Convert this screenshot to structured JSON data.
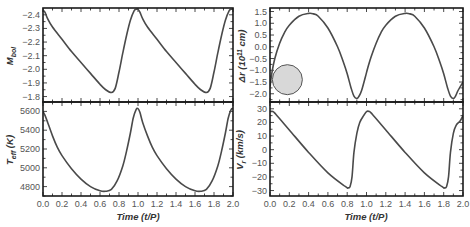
{
  "chart_data": [
    {
      "type": "line",
      "panel": "top-left",
      "title": "",
      "xlabel": "",
      "ylabel": "M_bol",
      "ylim": [
        -1.76,
        -2.45
      ],
      "y_inverted": true,
      "yticks": [
        -2.4,
        -2.3,
        -2.2,
        -2.1,
        -2.0,
        -1.9,
        -1.8
      ],
      "ytick_labels": [
        "-2.4",
        "-2.3",
        "-2.2",
        "-2.1",
        "-2.0",
        "-1.9",
        "-1.8"
      ],
      "xlim": [
        0.0,
        2.0
      ],
      "grid": false,
      "x": [
        0.0,
        0.02,
        0.05,
        0.1,
        0.2,
        0.3,
        0.4,
        0.5,
        0.6,
        0.66,
        0.72,
        0.76,
        0.8,
        0.84,
        0.88,
        0.92,
        0.96,
        0.98,
        1.0,
        1.02,
        1.05,
        1.1,
        1.2,
        1.3,
        1.4,
        1.5,
        1.6,
        1.66,
        1.72,
        1.76,
        1.8,
        1.84,
        1.88,
        1.92,
        1.96,
        1.98,
        2.0
      ],
      "values": [
        -2.43,
        -2.42,
        -2.37,
        -2.31,
        -2.22,
        -2.13,
        -2.05,
        -1.97,
        -1.89,
        -1.85,
        -1.83,
        -1.86,
        -1.98,
        -2.12,
        -2.25,
        -2.36,
        -2.43,
        -2.44,
        -2.44,
        -2.42,
        -2.37,
        -2.31,
        -2.22,
        -2.13,
        -2.05,
        -1.97,
        -1.89,
        -1.85,
        -1.83,
        -1.86,
        -1.98,
        -2.12,
        -2.25,
        -2.36,
        -2.43,
        -2.44,
        -2.44
      ]
    },
    {
      "type": "line",
      "panel": "bottom-left",
      "xlabel": "Time (t/P)",
      "ylabel": "T_eff (K)",
      "ylim": [
        4700,
        5700
      ],
      "yticks": [
        4800,
        5000,
        5200,
        5400,
        5600
      ],
      "ytick_labels": [
        "4800",
        "5000",
        "5200",
        "5400",
        "5600"
      ],
      "xlim": [
        0.0,
        2.0
      ],
      "xticks": [
        0.0,
        0.2,
        0.4,
        0.6,
        0.8,
        1.0,
        1.2,
        1.4,
        1.6,
        1.8,
        2.0
      ],
      "xtick_labels": [
        "0.0",
        "0.2",
        "0.4",
        "0.6",
        "0.8",
        "1.0",
        "1.2",
        "1.4",
        "1.6",
        "1.8",
        "2.0"
      ],
      "grid": false,
      "x": [
        0.0,
        0.02,
        0.05,
        0.1,
        0.15,
        0.2,
        0.3,
        0.4,
        0.5,
        0.6,
        0.66,
        0.72,
        0.78,
        0.84,
        0.88,
        0.92,
        0.95,
        0.98,
        1.0,
        1.02,
        1.05,
        1.1,
        1.15,
        1.2,
        1.3,
        1.4,
        1.5,
        1.6,
        1.66,
        1.72,
        1.78,
        1.84,
        1.88,
        1.92,
        1.95,
        1.98,
        2.0
      ],
      "values": [
        5600,
        5560,
        5480,
        5340,
        5220,
        5130,
        4990,
        4880,
        4800,
        4755,
        4750,
        4770,
        4860,
        5020,
        5180,
        5370,
        5530,
        5620,
        5630,
        5590,
        5480,
        5340,
        5220,
        5130,
        4990,
        4880,
        4800,
        4755,
        4750,
        4770,
        4860,
        5020,
        5180,
        5370,
        5530,
        5620,
        5630
      ]
    },
    {
      "type": "line",
      "panel": "top-right",
      "xlabel": "",
      "ylabel": "Δr (10^11 cm)",
      "ylim": [
        -2.35,
        1.65
      ],
      "yticks": [
        1.5,
        1.0,
        0.5,
        0.0,
        -0.5,
        -1.0,
        -1.5,
        -2.0
      ],
      "ytick_labels": [
        "1.5",
        "1.0",
        "0.5",
        "0.0",
        "-0.5",
        "-1.0",
        "-1.5",
        "-2.0"
      ],
      "xlim": [
        0.0,
        2.0
      ],
      "grid": false,
      "annotation": {
        "shape": "circle",
        "fill": "#d8d8d8",
        "stroke": "#555555",
        "cx_t": 0.18,
        "cy_val": -1.4,
        "radius_px": 15
      },
      "x": [
        0.0,
        0.02,
        0.05,
        0.1,
        0.15,
        0.2,
        0.3,
        0.4,
        0.45,
        0.5,
        0.6,
        0.7,
        0.76,
        0.8,
        0.84,
        0.87,
        0.9,
        0.92,
        0.95,
        1.0,
        1.02,
        1.05,
        1.1,
        1.15,
        1.2,
        1.3,
        1.4,
        1.45,
        1.5,
        1.6,
        1.7,
        1.76,
        1.8,
        1.84,
        1.87,
        1.9,
        1.92,
        1.95,
        2.0
      ],
      "values": [
        -1.7,
        -1.1,
        -0.5,
        0.15,
        0.6,
        0.92,
        1.3,
        1.42,
        1.4,
        1.3,
        0.8,
        0.0,
        -0.65,
        -1.15,
        -1.75,
        -2.1,
        -2.2,
        -2.12,
        -1.85,
        -1.1,
        -0.8,
        -0.4,
        0.15,
        0.6,
        0.92,
        1.3,
        1.42,
        1.4,
        1.3,
        0.8,
        0.0,
        -0.65,
        -1.15,
        -1.75,
        -2.1,
        -2.2,
        -2.12,
        -1.85,
        -1.5
      ]
    },
    {
      "type": "line",
      "panel": "bottom-right",
      "xlabel": "Time (t/P)",
      "ylabel": "V_r (km/s)",
      "ylim": [
        -34,
        35
      ],
      "yticks": [
        30,
        20,
        10,
        0,
        -10,
        -20,
        -30
      ],
      "ytick_labels": [
        "30",
        "20",
        "10",
        "0",
        "-10",
        "-20",
        "-30"
      ],
      "xlim": [
        0.0,
        2.0
      ],
      "xticks": [
        0.0,
        0.2,
        0.4,
        0.6,
        0.8,
        1.0,
        1.2,
        1.4,
        1.6,
        1.8,
        2.0
      ],
      "xtick_labels": [
        "0.0",
        "0.2",
        "0.4",
        "0.6",
        "0.8",
        "1.0",
        "1.2",
        "1.4",
        "1.6",
        "1.8",
        "2.0"
      ],
      "grid": false,
      "x": [
        0.0,
        0.03,
        0.06,
        0.2,
        0.4,
        0.6,
        0.78,
        0.81,
        0.83,
        0.85,
        0.87,
        0.9,
        0.93,
        0.97,
        1.0,
        1.03,
        1.06,
        1.2,
        1.4,
        1.6,
        1.78,
        1.81,
        1.83,
        1.85,
        1.87,
        1.9,
        1.93,
        1.97,
        2.0
      ],
      "values": [
        28,
        28,
        26,
        14.5,
        -2,
        -17,
        -27,
        -28,
        -27,
        -20,
        -2,
        12,
        20,
        25,
        28,
        28,
        26,
        14.5,
        -2,
        -17,
        -27,
        -28,
        -27,
        -20,
        -2,
        12,
        18,
        21,
        25
      ]
    }
  ],
  "labels": {
    "mbol_ylabel_main": "M",
    "mbol_ylabel_sub": "bol",
    "teff_ylabel_main": "T",
    "teff_ylabel_sub": "eff",
    "teff_ylabel_unit": " (K)",
    "dr_ylabel_pre": "Δr (10",
    "dr_ylabel_sup": "11",
    "dr_ylabel_post": " cm)",
    "vr_ylabel_main": "V",
    "vr_ylabel_sub": "r",
    "vr_ylabel_unit": " (km/s)",
    "xlabel_left": "Time (t/P)",
    "xlabel_right": "Time (t/P)"
  },
  "colors": {
    "curve": "#4a4a4a",
    "frame": "#1a1a1a",
    "tick_text": "#555555",
    "circle_fill": "#d8d8d8",
    "circle_stroke": "#555555"
  }
}
